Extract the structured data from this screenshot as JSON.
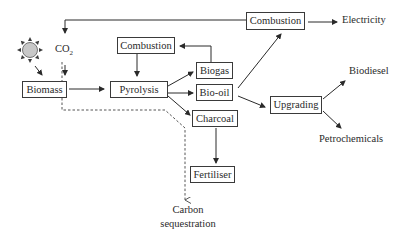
{
  "diagram": {
    "nodes": {
      "sun": {
        "icon": "sun-icon"
      },
      "co2": {
        "label": "CO",
        "subscript": "2"
      },
      "biomass": {
        "label": "Biomass"
      },
      "pyrolysis": {
        "label": "Pyrolysis"
      },
      "combustion_loop": {
        "label": "Combustion"
      },
      "biogas": {
        "label": "Biogas"
      },
      "biooil": {
        "label": "Bio-oil"
      },
      "charcoal": {
        "label": "Charcoal"
      },
      "fertiliser": {
        "label": "Fertiliser"
      },
      "combustion_top": {
        "label": "Combustion"
      },
      "electricity": {
        "label": "Electricity"
      },
      "upgrading": {
        "label": "Upgrading"
      },
      "biodiesel": {
        "label": "Biodiesel"
      },
      "petrochemicals": {
        "label": "Petrochemicals"
      },
      "carbon_sequestration": {
        "line1": "Carbon",
        "line2": "sequestration"
      }
    },
    "edges": [
      {
        "from": "sun",
        "to": "biomass",
        "style": "solid"
      },
      {
        "from": "co2",
        "to": "biomass",
        "style": "solid"
      },
      {
        "from": "biomass",
        "to": "pyrolysis",
        "style": "solid"
      },
      {
        "from": "combustion_loop",
        "to": "pyrolysis",
        "style": "solid"
      },
      {
        "from": "biogas",
        "to": "combustion_loop",
        "style": "solid"
      },
      {
        "from": "pyrolysis",
        "to": "biogas",
        "style": "solid"
      },
      {
        "from": "pyrolysis",
        "to": "biooil",
        "style": "solid"
      },
      {
        "from": "pyrolysis",
        "to": "charcoal",
        "style": "solid"
      },
      {
        "from": "charcoal",
        "to": "fertiliser",
        "style": "solid"
      },
      {
        "from": "biooil",
        "to": "combustion_top",
        "style": "solid"
      },
      {
        "from": "biooil",
        "to": "upgrading",
        "style": "solid"
      },
      {
        "from": "combustion_top",
        "to": "electricity",
        "style": "solid"
      },
      {
        "from": "combustion_top",
        "to": "co2",
        "style": "solid"
      },
      {
        "from": "upgrading",
        "to": "biodiesel",
        "style": "solid"
      },
      {
        "from": "upgrading",
        "to": "petrochemicals",
        "style": "solid"
      },
      {
        "from": "biomass",
        "to": "carbon_sequestration",
        "style": "dashed"
      }
    ]
  },
  "colors": {
    "line": "#2a2a2a",
    "dashed": "#555555",
    "sun_fill": "#c8c8c8"
  }
}
